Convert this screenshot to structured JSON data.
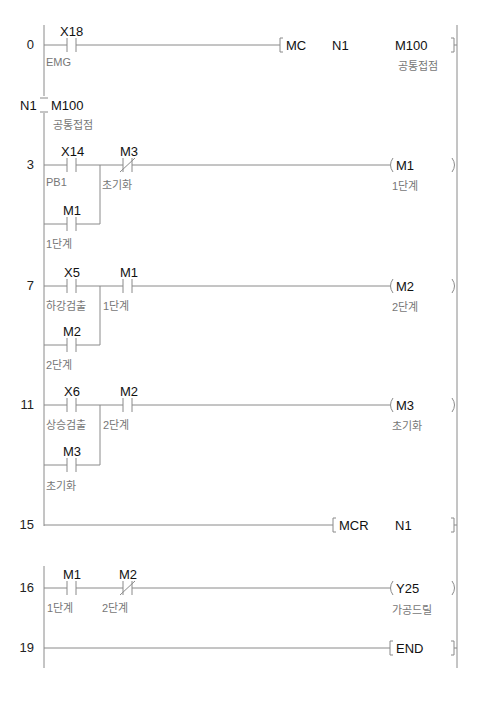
{
  "ladder": {
    "rungs": [
      {
        "step": "0",
        "contacts": [
          {
            "device": "X18",
            "comment": "EMG",
            "type": "NO"
          }
        ],
        "instruction": {
          "op": "MC",
          "args": [
            "N1",
            "M100"
          ],
          "comment": "공통접점"
        }
      },
      {
        "nest": {
          "label": "N1",
          "device": "M100",
          "comment": "공통접점"
        }
      },
      {
        "step": "3",
        "contacts": [
          {
            "device": "X14",
            "comment": "PB1",
            "type": "NO"
          },
          {
            "device": "M3",
            "comment": "초기화",
            "type": "NC"
          }
        ],
        "branch": {
          "device": "M1",
          "comment": "1단계",
          "type": "NO"
        },
        "coil": {
          "device": "M1",
          "comment": "1단계"
        }
      },
      {
        "step": "7",
        "contacts": [
          {
            "device": "X5",
            "comment": "하강검출",
            "type": "NO"
          },
          {
            "device": "M1",
            "comment": "1단계",
            "type": "NO"
          }
        ],
        "branch": {
          "device": "M2",
          "comment": "2단계",
          "type": "NO"
        },
        "coil": {
          "device": "M2",
          "comment": "2단계"
        }
      },
      {
        "step": "11",
        "contacts": [
          {
            "device": "X6",
            "comment": "상승검출",
            "type": "NO"
          },
          {
            "device": "M2",
            "comment": "2단계",
            "type": "NO"
          }
        ],
        "branch": {
          "device": "M3",
          "comment": "초기화",
          "type": "NO"
        },
        "coil": {
          "device": "M3",
          "comment": "초기화"
        }
      },
      {
        "step": "15",
        "instruction": {
          "op": "MCR",
          "args": [
            "N1"
          ]
        }
      },
      {
        "step": "16",
        "contacts": [
          {
            "device": "M1",
            "comment": "1단계",
            "type": "NO"
          },
          {
            "device": "M2",
            "comment": "2단계",
            "type": "NC"
          }
        ],
        "coil": {
          "device": "Y25",
          "comment": "가공드릴"
        }
      },
      {
        "step": "19",
        "instruction": {
          "op": "END",
          "args": []
        }
      }
    ]
  }
}
